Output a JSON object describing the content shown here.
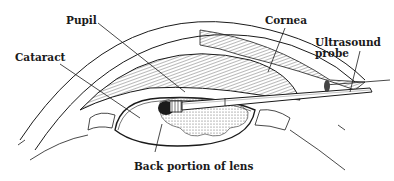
{
  "diagram": {
    "labels": {
      "pupil": "Pupil",
      "cataract": "Cataract",
      "cornea": "Cornea",
      "ultrasound_probe": "Ultrasound\nprobe",
      "back_of_lens": "Back portion of lens"
    },
    "colors": {
      "ink": "#1a1a1a",
      "background": "#ffffff",
      "shading": "#8a8a8a"
    }
  }
}
